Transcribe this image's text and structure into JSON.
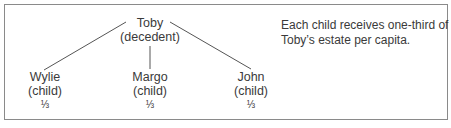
{
  "diagram": {
    "type": "family-tree",
    "root": {
      "name": "Toby",
      "role": "(decedent)"
    },
    "children": [
      {
        "name": "Wylie",
        "role": "(child)",
        "share": "⅓"
      },
      {
        "name": "Margo",
        "role": "(child)",
        "share": "⅓"
      },
      {
        "name": "John",
        "role": "(child)",
        "share": "⅓"
      }
    ],
    "note": {
      "line1": "Each child receives one-third of",
      "line2": "Toby’s estate per capita."
    },
    "colors": {
      "line": "#555555",
      "border": "#8a8a8a",
      "text": "#3a3a3a"
    }
  }
}
